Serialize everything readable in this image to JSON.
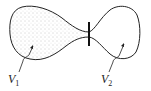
{
  "diagram": {
    "regions": [
      {
        "id": "V1",
        "label": "V",
        "subscript": "1",
        "fill": "stippled (gas)"
      },
      {
        "id": "V2",
        "label": "V",
        "subscript": "2",
        "fill": "empty (vacuum)"
      }
    ],
    "valve": {
      "label": "",
      "position": "neck between volumes"
    },
    "colors": {
      "stroke": "#222222",
      "stipple": "#888888",
      "background": "#ffffff"
    }
  }
}
